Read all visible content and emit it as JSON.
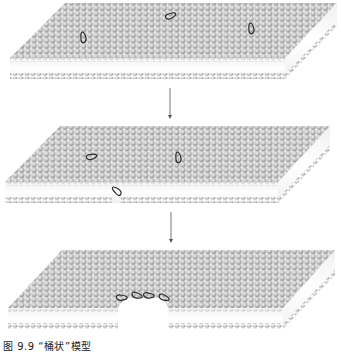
{
  "figure": {
    "caption": "图 9.9  “桶状”模型",
    "colors": {
      "lipid_head": "#c8c8c8",
      "lipid_head_highlight": "#f2f2f2",
      "lipid_head_shadow": "#8c8c8c",
      "membrane_core": "#ffffff",
      "helix": "#2a2a2a",
      "arrow": "#555555",
      "background": "#ffffff"
    },
    "panels": [
      {
        "id": "stage-1",
        "description": "Peptide helices lying flat on the membrane surface",
        "top_y": 3,
        "front_y": 58,
        "bottom_y": 78,
        "helices": [
          {
            "x": 95,
            "y": 33,
            "angle": -20
          },
          {
            "x": 178,
            "y": 26,
            "angle": 55
          },
          {
            "x": 263,
            "y": 24,
            "angle": -20
          }
        ]
      },
      {
        "id": "stage-2",
        "description": "Helices begin inserting into the bilayer",
        "top_y": 126,
        "front_y": 182,
        "bottom_y": 203,
        "helices": [
          {
            "x": 97,
            "y": 168,
            "angle": 65
          },
          {
            "x": 123,
            "y": 180,
            "angle": -60
          },
          {
            "x": 190,
            "y": 153,
            "angle": -20
          }
        ]
      },
      {
        "id": "stage-3",
        "description": "Helices assemble into a transmembrane barrel-stave pore",
        "top_y": 250,
        "front_y": 308,
        "bottom_y": 329,
        "helices": [
          {
            "x": 128,
            "y": 307,
            "angle": 85
          },
          {
            "x": 138,
            "y": 307,
            "angle": 95
          },
          {
            "x": 150,
            "y": 307,
            "angle": 85
          },
          {
            "x": 160,
            "y": 307,
            "angle": 95
          }
        ]
      }
    ],
    "arrows": [
      {
        "x": 170,
        "y1": 88,
        "y2": 118
      },
      {
        "x": 171,
        "y1": 212,
        "y2": 242
      }
    ]
  }
}
